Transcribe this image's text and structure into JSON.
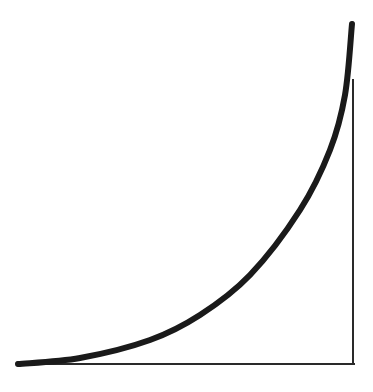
{
  "diagram": {
    "colors": {
      "background": "#ffffff",
      "curve": "#1a1a1a",
      "lines": "#2a2a2a"
    },
    "curve": {
      "points": [
        [
          18,
          364
        ],
        [
          80,
          358
        ],
        [
          150,
          340
        ],
        [
          200,
          315
        ],
        [
          250,
          275
        ],
        [
          300,
          210
        ],
        [
          330,
          150
        ],
        [
          345,
          95
        ],
        [
          352,
          24
        ]
      ],
      "stroke_width": 6
    },
    "baseline": {
      "x1": 18,
      "y1": 364,
      "x2": 354,
      "y2": 364,
      "stroke_width": 2
    },
    "vertical_line": {
      "x1": 353,
      "y1": 80,
      "x2": 353,
      "y2": 364,
      "stroke_width": 2
    }
  }
}
